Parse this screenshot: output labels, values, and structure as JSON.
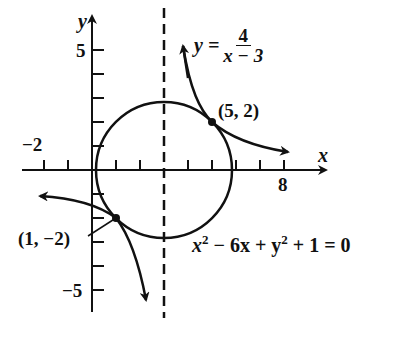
{
  "diagram": {
    "type": "coordinate-graph",
    "axes": {
      "x_label": "x",
      "y_label": "y",
      "x_tick_labels": [
        {
          "value": -2,
          "text": "−2"
        },
        {
          "value": 8,
          "text": "8"
        }
      ],
      "y_tick_labels": [
        {
          "value": 5,
          "text": "5"
        },
        {
          "value": -5,
          "text": "−5"
        }
      ],
      "x_ticks": [
        -2,
        -1,
        1,
        2,
        3,
        4,
        5,
        6,
        7,
        8
      ],
      "y_ticks": [
        -5,
        -4,
        -3,
        -2,
        -1,
        1,
        2,
        3,
        4,
        5
      ],
      "asymptote": {
        "x": 3,
        "style": "dashed"
      }
    },
    "curves": {
      "hyperbola": {
        "label_lhs": "y =",
        "numerator": "4",
        "denominator": "x − 3"
      },
      "circle": {
        "equation_parts": [
          "x",
          "2",
          " − 6x + y",
          "2",
          " + 1 = 0"
        ],
        "center": [
          3,
          0
        ],
        "radius": 2.828
      }
    },
    "points": [
      {
        "label": "(5, 2)",
        "x": 5,
        "y": 2
      },
      {
        "label": "(1, −2)",
        "x": 1,
        "y": -2
      }
    ]
  },
  "colors": {
    "ink": "#111111",
    "background": "#ffffff"
  }
}
